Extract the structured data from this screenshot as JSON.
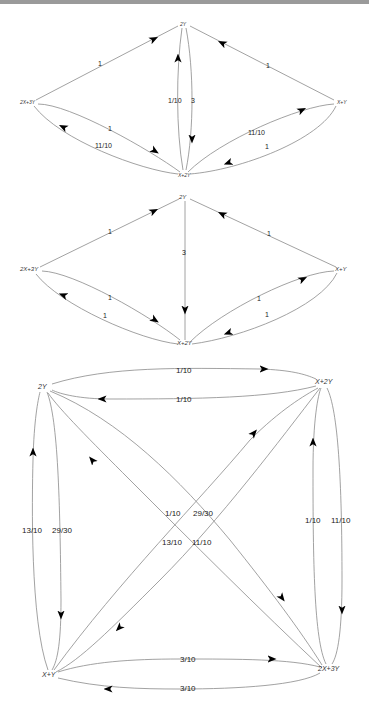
{
  "diagrams": [
    {
      "id": "graph1",
      "nodes": [
        {
          "label": "2Y",
          "x": 184,
          "y": 24,
          "size": 5
        },
        {
          "label": "2X+3Y",
          "x": 26,
          "y": 102,
          "size": 5
        },
        {
          "label": "X+Y",
          "x": 342,
          "y": 102,
          "size": 5
        },
        {
          "label": "X+2Y",
          "x": 184,
          "y": 174,
          "size": 5
        }
      ],
      "edges": [
        {
          "from": "2X+3Y",
          "to": "2Y",
          "label": "1"
        },
        {
          "from": "X+Y",
          "to": "2Y",
          "label": "1"
        },
        {
          "from": "X+2Y",
          "to": "2Y",
          "label": "1/10"
        },
        {
          "from": "2Y",
          "to": "X+2Y",
          "label": "3"
        },
        {
          "from": "2X+3Y",
          "to": "X+2Y",
          "label": "1"
        },
        {
          "from": "X+2Y",
          "to": "2X+3Y",
          "label": "11/10"
        },
        {
          "from": "X+2Y",
          "to": "X+Y",
          "label": "11/10"
        },
        {
          "from": "X+Y",
          "to": "X+2Y",
          "label": "1"
        }
      ]
    },
    {
      "id": "graph2",
      "nodes": [
        {
          "label": "2Y",
          "x": 184,
          "y": 197,
          "size": 6
        },
        {
          "label": "2X+3Y",
          "x": 30,
          "y": 269,
          "size": 6
        },
        {
          "label": "X+Y",
          "x": 341,
          "y": 269,
          "size": 6
        },
        {
          "label": "X+2Y",
          "x": 184,
          "y": 342,
          "size": 6
        }
      ],
      "edges": [
        {
          "from": "2X+3Y",
          "to": "2Y",
          "label": "1"
        },
        {
          "from": "X+Y",
          "to": "2Y",
          "label": "1"
        },
        {
          "from": "2Y",
          "to": "X+2Y",
          "label": "3"
        },
        {
          "from": "2X+3Y",
          "to": "X+2Y",
          "label": "1"
        },
        {
          "from": "X+2Y",
          "to": "2X+3Y",
          "label": "1"
        },
        {
          "from": "X+2Y",
          "to": "X+Y",
          "label": "1"
        },
        {
          "from": "X+Y",
          "to": "X+2Y",
          "label": "1"
        }
      ]
    },
    {
      "id": "graph3",
      "nodes": [
        {
          "label": "2Y",
          "x": 44,
          "y": 387,
          "size": 7
        },
        {
          "label": "X+2Y",
          "x": 324,
          "y": 382,
          "size": 7
        },
        {
          "label": "X+Y",
          "x": 49,
          "y": 675,
          "size": 7
        },
        {
          "label": "2X+3Y",
          "x": 329,
          "y": 669,
          "size": 7
        }
      ],
      "edges": [
        {
          "from": "2Y",
          "to": "X+2Y",
          "label": "1/10"
        },
        {
          "from": "X+2Y",
          "to": "2Y",
          "label": "1/10"
        },
        {
          "from": "X+Y",
          "to": "2Y",
          "label": "13/10"
        },
        {
          "from": "2Y",
          "to": "X+Y",
          "label": "29/30"
        },
        {
          "from": "X+Y",
          "to": "X+2Y",
          "label": "1/10"
        },
        {
          "from": "2Y",
          "to": "2X+3Y",
          "label": "29/30"
        },
        {
          "from": "2X+3Y",
          "to": "2Y",
          "label": "13/10"
        },
        {
          "from": "X+2Y",
          "to": "X+Y",
          "label": "11/10"
        },
        {
          "from": "2X+3Y",
          "to": "X+2Y",
          "label": "1/10"
        },
        {
          "from": "X+2Y",
          "to": "2X+3Y",
          "label": "11/10"
        },
        {
          "from": "X+Y",
          "to": "2X+3Y",
          "label": "3/10"
        },
        {
          "from": "2X+3Y",
          "to": "X+Y",
          "label": "3/10"
        }
      ]
    }
  ],
  "colors": {
    "edge": "#8a8a8a",
    "arrow": "#000000",
    "label": "#222222",
    "topbar": "#9a9a9a"
  }
}
